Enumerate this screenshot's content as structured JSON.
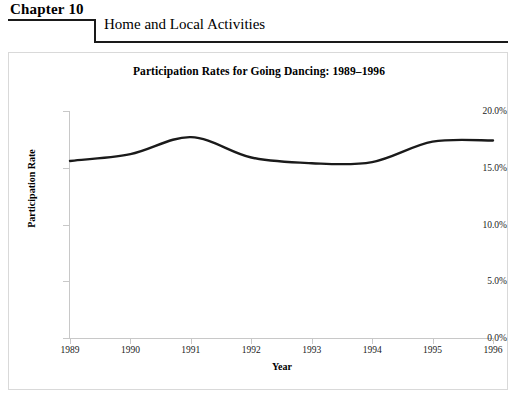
{
  "header": {
    "chapter_label": "Chapter 10",
    "section_title": "Home and Local Activities"
  },
  "chart_data": {
    "type": "line",
    "title": "Participation Rates for Going Dancing: 1989–1996",
    "xlabel": "Year",
    "ylabel": "Participation Rate",
    "categories": [
      "1989",
      "1990",
      "1991",
      "1992",
      "1993",
      "1994",
      "1995",
      "1996"
    ],
    "x": [
      1989,
      1990,
      1991,
      1992,
      1993,
      1994,
      1995,
      1996
    ],
    "values": [
      15.6,
      16.2,
      17.7,
      15.9,
      15.4,
      15.5,
      17.3,
      17.4
    ],
    "series": [
      {
        "name": "Going Dancing",
        "values": [
          15.6,
          16.2,
          17.7,
          15.9,
          15.4,
          15.5,
          17.3,
          17.4
        ],
        "color": "#1a1a1a",
        "line_width": 2.4,
        "smooth": true
      }
    ],
    "ylim": [
      0.0,
      20.0
    ],
    "ytick_values": [
      20.0,
      15.0,
      10.0,
      5.0,
      0.0
    ],
    "ytick_labels": [
      "20.0%",
      "15.0%",
      "10.0%",
      "5.0%",
      "0.0%"
    ],
    "xlim": [
      1989,
      1996
    ],
    "grid": false,
    "legend": "none",
    "frame_color": "#d9d9d9",
    "axis_color": "#c8c8c8"
  }
}
